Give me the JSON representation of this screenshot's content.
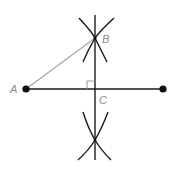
{
  "diagram": {
    "labels": {
      "a": "A",
      "b": "B",
      "c": "C"
    },
    "colors": {
      "line": "#1a1a1a",
      "segment_ab": "#a8a8a8",
      "label": "#8a8a8a",
      "right_angle_marker": "#9a9a9a"
    },
    "points": {
      "A": [
        26,
        89
      ],
      "right_endpoint": [
        163,
        89
      ],
      "B": [
        95,
        38
      ],
      "C": [
        95,
        89
      ],
      "lower_intersection": [
        95,
        140
      ]
    }
  }
}
